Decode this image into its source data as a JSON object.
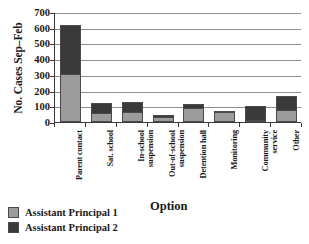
{
  "chart_data": {
    "type": "bar",
    "subtype": "stacked-vertical",
    "title": "",
    "xlabel": "Option",
    "ylabel": "No. Cases Sep–Feb",
    "ylim": [
      0,
      700
    ],
    "ytick_step": 100,
    "yticks": [
      "700",
      "600",
      "500",
      "400",
      "300",
      "200",
      "100",
      "0"
    ],
    "grid": "horizontal",
    "legend_position": "bottom-left",
    "categories": [
      "Parent contact",
      "Sat. school",
      "In-school\nsuspension",
      "Out-of-school\nsuspension",
      "Detention hall",
      "Monitoring",
      "Community\nservice",
      "Other"
    ],
    "series": [
      {
        "name": "Assistant Principal 1",
        "color": "#9c9c9c",
        "values": [
          305,
          58,
          62,
          30,
          88,
          62,
          15,
          75
        ]
      },
      {
        "name": "Assistant Principal 2",
        "color": "#3a3a3a",
        "values": [
          310,
          65,
          68,
          15,
          27,
          3,
          85,
          90
        ]
      }
    ],
    "totals": [
      615,
      123,
      130,
      45,
      115,
      65,
      100,
      165
    ]
  },
  "legend": {
    "items": [
      {
        "label": "Assistant Principal 1",
        "swatch": "ap1"
      },
      {
        "label": "Assistant Principal 2",
        "swatch": "ap2"
      }
    ]
  }
}
